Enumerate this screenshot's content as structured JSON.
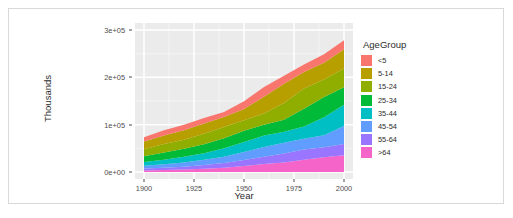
{
  "chart_data": {
    "type": "area",
    "stacked": true,
    "title": "",
    "xlabel": "Year",
    "ylabel": "Thousands",
    "xlim": [
      1900,
      2000
    ],
    "ylim": [
      0,
      300000
    ],
    "grid": true,
    "legend_position": "right",
    "legend_title": "AgeGroup",
    "x_ticks": [
      "1900",
      "1925",
      "1950",
      "1975",
      "2000"
    ],
    "x_tick_values": [
      1900,
      1925,
      1950,
      1975,
      2000
    ],
    "y_ticks": [
      "0e+00",
      "1e+05",
      "2e+05",
      "3e+05"
    ],
    "y_tick_values": [
      0,
      100000,
      200000,
      300000
    ],
    "x": [
      1900,
      1910,
      1920,
      1930,
      1940,
      1950,
      1960,
      1970,
      1980,
      1990,
      2000
    ],
    "series": [
      {
        "name": "<5",
        "color": "#f8766d",
        "values": [
          9171,
          10926,
          11573,
          11444,
          10542,
          16163,
          20341,
          17154,
          16348,
          18354,
          19176
        ]
      },
      {
        "name": "5-14",
        "color": "#b79f00",
        "values": [
          16000,
          18000,
          20000,
          22000,
          21000,
          24000,
          35500,
          40700,
          34900,
          35100,
          41000
        ]
      },
      {
        "name": "15-24",
        "color": "#8fae00",
        "values": [
          15000,
          18000,
          19000,
          22000,
          24000,
          22000,
          24000,
          35400,
          42500,
          37000,
          39200
        ]
      },
      {
        "name": "25-34",
        "color": "#00ba38",
        "values": [
          12000,
          15000,
          17000,
          19000,
          21000,
          24000,
          22900,
          25300,
          37600,
          43200,
          37400
        ]
      },
      {
        "name": "35-44",
        "color": "#00bfc4",
        "values": [
          8000,
          10000,
          12000,
          14000,
          18000,
          21000,
          24000,
          23100,
          25900,
          37900,
          44900
        ]
      },
      {
        "name": "45-54",
        "color": "#619cff",
        "values": [
          6000,
          7000,
          9000,
          11000,
          13000,
          17000,
          20600,
          23200,
          22800,
          25200,
          37700
        ]
      },
      {
        "name": "55-64",
        "color": "#9a75ff",
        "values": [
          4000,
          5000,
          6000,
          8000,
          10000,
          13000,
          15600,
          18600,
          21700,
          21100,
          24300
        ]
      },
      {
        "name": ">64",
        "color": "#f564c9",
        "values": [
          3080,
          3950,
          4930,
          6630,
          9030,
          12300,
          16600,
          20100,
          25700,
          31200,
          35000
        ]
      }
    ]
  },
  "legend": {
    "title": "AgeGroup",
    "items": [
      {
        "label": "<5",
        "color": "#f8766d"
      },
      {
        "label": "5-14",
        "color": "#b79f00"
      },
      {
        "label": "15-24",
        "color": "#8fae00"
      },
      {
        "label": "25-34",
        "color": "#00ba38"
      },
      {
        "label": "35-44",
        "color": "#00bfc4"
      },
      {
        "label": "45-54",
        "color": "#619cff"
      },
      {
        "label": "55-64",
        "color": "#9a75ff"
      },
      {
        "label": ">64",
        "color": "#f564c9"
      }
    ]
  },
  "theme": {
    "panel_background": "#ebebeb",
    "gridline_major": "#ffffff",
    "gridline_minor": "#f5f5f5",
    "text_color": "#2b2b2b",
    "tick_color": "#4d4d4d",
    "frame_border": "#d9d9d9"
  }
}
